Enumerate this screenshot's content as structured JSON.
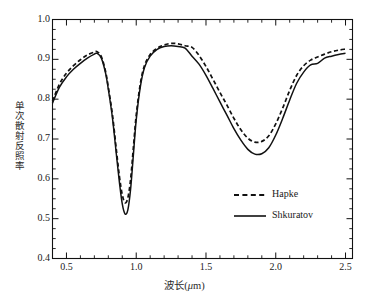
{
  "chart_data": {
    "type": "line",
    "title": "",
    "subtitle": "",
    "xlabel": "波长(μm)",
    "xlabel_prefix": "波长(",
    "xlabel_unit": "μ",
    "xlabel_suffix": "m)",
    "ylabel": "单次散射反照率",
    "xlim": [
      0.4,
      2.55
    ],
    "ylim": [
      0.4,
      1.0
    ],
    "xticks": [
      0.5,
      1.0,
      1.5,
      2.0,
      2.5
    ],
    "xtick_labels": [
      "0.5",
      "1.0",
      "1.5",
      "2.0",
      "2.5"
    ],
    "yticks": [
      0.4,
      0.5,
      0.6,
      0.7,
      0.8,
      0.9,
      1.0
    ],
    "ytick_labels": [
      "0.4",
      "0.5",
      "0.6",
      "0.7",
      "0.8",
      "0.9",
      "1.0"
    ],
    "x_minor_interval": 0.1,
    "y_minor_interval": 0.025,
    "grid": false,
    "legend_position": "lower-right-inside",
    "axis_color": "#111111",
    "series": [
      {
        "name": "Hapke",
        "style": "dashed",
        "color": "#111111",
        "x": [
          0.4,
          0.45,
          0.5,
          0.55,
          0.6,
          0.65,
          0.7,
          0.72,
          0.75,
          0.78,
          0.8,
          0.83,
          0.86,
          0.88,
          0.9,
          0.92,
          0.94,
          0.96,
          0.98,
          1.0,
          1.03,
          1.06,
          1.1,
          1.15,
          1.2,
          1.25,
          1.3,
          1.35,
          1.4,
          1.45,
          1.5,
          1.55,
          1.6,
          1.65,
          1.7,
          1.75,
          1.8,
          1.85,
          1.9,
          1.95,
          2.0,
          2.05,
          2.1,
          2.15,
          2.2,
          2.25,
          2.3,
          2.35,
          2.4,
          2.45,
          2.5
        ],
        "y": [
          0.795,
          0.838,
          0.865,
          0.884,
          0.899,
          0.911,
          0.918,
          0.919,
          0.907,
          0.87,
          0.83,
          0.76,
          0.665,
          0.605,
          0.56,
          0.54,
          0.552,
          0.6,
          0.68,
          0.76,
          0.84,
          0.885,
          0.912,
          0.928,
          0.936,
          0.94,
          0.939,
          0.934,
          0.93,
          0.91,
          0.882,
          0.85,
          0.817,
          0.785,
          0.752,
          0.723,
          0.702,
          0.692,
          0.694,
          0.708,
          0.738,
          0.778,
          0.822,
          0.86,
          0.884,
          0.898,
          0.906,
          0.913,
          0.919,
          0.923,
          0.926
        ]
      },
      {
        "name": "Shkuratov",
        "style": "solid",
        "color": "#111111",
        "x": [
          0.4,
          0.45,
          0.5,
          0.55,
          0.6,
          0.65,
          0.7,
          0.72,
          0.75,
          0.78,
          0.8,
          0.83,
          0.86,
          0.88,
          0.9,
          0.92,
          0.94,
          0.96,
          0.98,
          1.0,
          1.03,
          1.06,
          1.1,
          1.15,
          1.2,
          1.25,
          1.3,
          1.35,
          1.4,
          1.45,
          1.5,
          1.55,
          1.6,
          1.65,
          1.7,
          1.75,
          1.8,
          1.85,
          1.9,
          1.95,
          2.0,
          2.05,
          2.1,
          2.15,
          2.2,
          2.25,
          2.3,
          2.35,
          2.4,
          2.45,
          2.5
        ],
        "y": [
          0.79,
          0.83,
          0.856,
          0.875,
          0.89,
          0.903,
          0.913,
          0.915,
          0.903,
          0.866,
          0.825,
          0.752,
          0.654,
          0.59,
          0.537,
          0.512,
          0.522,
          0.575,
          0.662,
          0.748,
          0.832,
          0.88,
          0.908,
          0.925,
          0.932,
          0.934,
          0.932,
          0.928,
          0.908,
          0.888,
          0.86,
          0.827,
          0.793,
          0.76,
          0.726,
          0.697,
          0.674,
          0.662,
          0.663,
          0.678,
          0.71,
          0.752,
          0.798,
          0.84,
          0.868,
          0.886,
          0.89,
          0.903,
          0.908,
          0.912,
          0.915
        ]
      }
    ],
    "annotations": []
  },
  "legend": {
    "entries": [
      {
        "label": "Hapke",
        "style": "dashed"
      },
      {
        "label": "Shkuratov",
        "style": "solid"
      }
    ]
  }
}
